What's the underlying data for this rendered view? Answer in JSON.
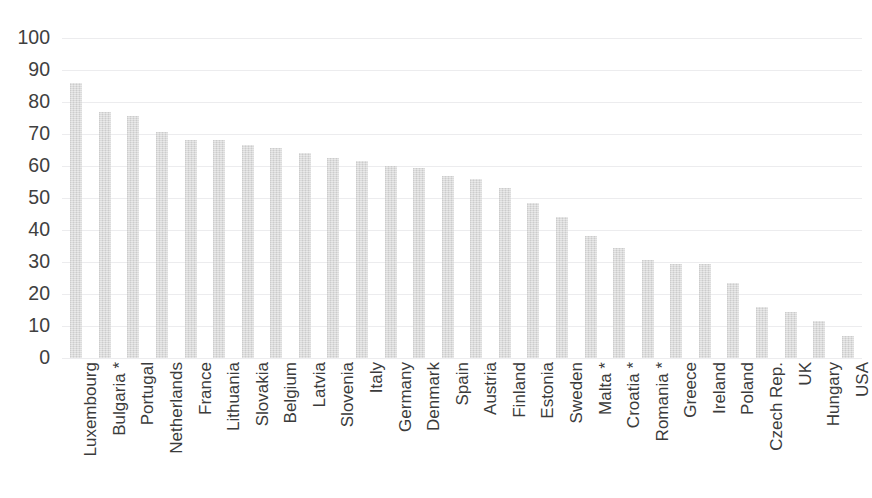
{
  "chart_data": {
    "type": "bar",
    "title": "",
    "xlabel": "",
    "ylabel": "",
    "ylim": [
      0,
      100
    ],
    "yticks": [
      0,
      10,
      20,
      30,
      40,
      50,
      60,
      70,
      80,
      90,
      100
    ],
    "grid": true,
    "legend": "none",
    "bar_color": "#d6d6d6",
    "categories": [
      "Luxembourg",
      "Bulgaria *",
      "Portugal",
      "Netherlands",
      "France",
      "Lithuania",
      "Slovakia",
      "Belgium",
      "Latvia",
      "Slovenia",
      "Italy",
      "Germany",
      "Denmark",
      "Spain",
      "Austria",
      "Finland",
      "Estonia",
      "Sweden",
      "Malta *",
      "Croatia *",
      "Romania *",
      "Greece",
      "Ireland",
      "Poland",
      "Czech Rep.",
      "UK",
      "Hungary",
      "USA"
    ],
    "values": [
      86,
      77,
      75.5,
      70.5,
      68,
      68,
      66.5,
      65.5,
      64,
      62.5,
      61.5,
      60,
      59.5,
      57,
      56,
      53,
      48.5,
      44,
      38,
      34.5,
      30.5,
      29.5,
      29.5,
      23.5,
      16,
      14.5,
      11.5,
      7
    ]
  },
  "title_remnant": ""
}
